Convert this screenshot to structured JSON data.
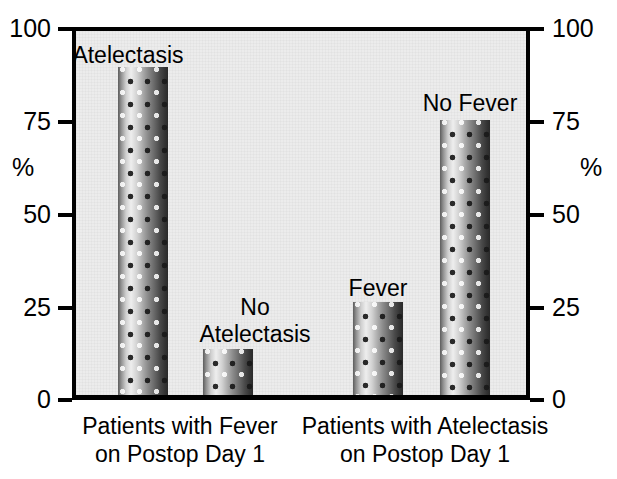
{
  "chart_data": {
    "type": "bar",
    "title": "",
    "subtitle": "",
    "xlabel": "",
    "ylabel": "%",
    "ylabel_right": "%",
    "ylim": [
      0,
      100
    ],
    "grid": false,
    "legend": "none",
    "y_ticks": [
      "100",
      "75",
      "50",
      "25",
      "0"
    ],
    "y_tick_values": [
      100,
      75,
      50,
      25,
      0
    ],
    "groups": [
      {
        "label": "Patients with Fever\non Postop Day 1",
        "bars": [
          {
            "label": "Atelectasis",
            "value": 90
          },
          {
            "label": "No\nAtelectasis",
            "value": 12.5
          }
        ]
      },
      {
        "label": "Patients with Atelectasis\non Postop Day 1",
        "bars": [
          {
            "label": "Fever",
            "value": 25.5
          },
          {
            "label": "No Fever",
            "value": 75.5
          }
        ]
      }
    ],
    "categories": [
      "Atelectasis",
      "No Atelectasis",
      "Fever",
      "No Fever"
    ],
    "values": [
      90,
      12.5,
      25.5,
      75.5
    ],
    "colors": {
      "plot_background": "#ececec",
      "axis": "#000000",
      "text": "#000000",
      "bar_light": "#eeeeee",
      "bar_dark": "#2a2a2a"
    }
  },
  "axis": {
    "left_title": "%",
    "right_title": "%",
    "tick_100": "100",
    "tick_75": "75",
    "tick_50": "50",
    "tick_25": "25",
    "tick_0": "0"
  },
  "bar_labels": {
    "atelectasis": "Atelectasis",
    "no_atelectasis": "No\nAtelectasis",
    "fever": "Fever",
    "no_fever": "No Fever"
  },
  "group_labels": {
    "fever_group": "Patients with Fever\non Postop Day 1",
    "atelectasis_group": "Patients with Atelectasis\non Postop Day 1"
  }
}
